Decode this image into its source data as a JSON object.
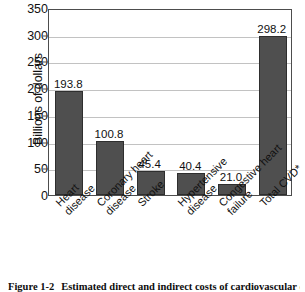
{
  "chart_data": {
    "type": "bar",
    "title": "",
    "xlabel": "",
    "ylabel": "Billions of dollars",
    "ylim": [
      0,
      350
    ],
    "ytick_step": 50,
    "yticks": [
      0,
      50,
      100,
      150,
      200,
      250,
      300,
      350
    ],
    "grid": true,
    "legend": false,
    "bar_color": "#4f4f4f",
    "categories": [
      "Heart disease",
      "Coronary heart disease",
      "Stroke",
      "Hypertensive disease",
      "Congestive heart failure",
      "Total CVD*"
    ],
    "category_lines": [
      [
        "Heart",
        "disease"
      ],
      [
        "Coronary heart",
        "disease"
      ],
      [
        "Stroke"
      ],
      [
        "Hypertensive",
        "disease"
      ],
      [
        "Congestive heart",
        "failure"
      ],
      [
        "Total CVD*"
      ]
    ],
    "values": [
      193.8,
      100.8,
      45.4,
      40.4,
      21.0,
      298.2
    ],
    "value_labels": [
      "193.8",
      "100.8",
      "45.4",
      "40.4",
      "21.0",
      "298.2"
    ]
  },
  "axis": {
    "y_title": "Billions of dollars",
    "tick_labels": [
      "350",
      "300",
      "250",
      "200",
      "150",
      "100",
      "50",
      "0"
    ]
  },
  "caption": {
    "figure_number": "Figure 1-2",
    "text": "Estimated direct and indirect costs of cardiovascular disease"
  }
}
